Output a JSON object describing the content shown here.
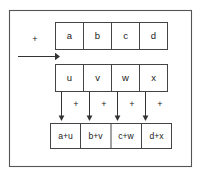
{
  "figure": {
    "background_color": "#ffffff",
    "frame_color": "#555555",
    "box_stroke_color": "#444444",
    "text_color": "#1a1a1a",
    "operator": "+",
    "rows": [
      {
        "name": "top-operand-row",
        "cells": [
          {
            "label": "a"
          },
          {
            "label": "b"
          },
          {
            "label": "c"
          },
          {
            "label": "d"
          }
        ]
      },
      {
        "name": "bottom-operand-row",
        "cells": [
          {
            "label": "u"
          },
          {
            "label": "v"
          },
          {
            "label": "w"
          },
          {
            "label": "x"
          }
        ]
      },
      {
        "name": "result-row",
        "cells": [
          {
            "label": "a+u"
          },
          {
            "label": "b+v"
          },
          {
            "label": "c+w"
          },
          {
            "label": "d+x"
          }
        ]
      }
    ],
    "column_operators": [
      "+",
      "+",
      "+",
      "+"
    ],
    "left_operator": "+"
  }
}
